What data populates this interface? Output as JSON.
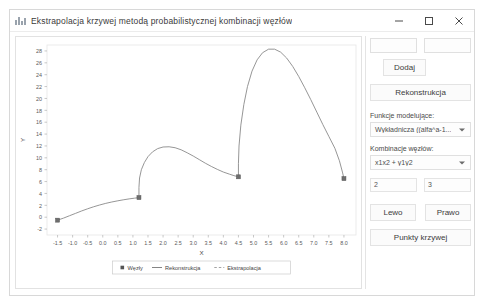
{
  "window": {
    "title": "Ekstrapolacja krzywej metodą probabilistycznej kombinacji węzłów",
    "icon": "chart-bars-icon",
    "minimize_label": "—",
    "maximize_label": "□",
    "close_label": "✕"
  },
  "panel": {
    "input_x": "",
    "input_y": "",
    "add_label": "Dodaj",
    "reconstruct_label": "Rekonstrukcja",
    "functions_label": "Funkcje modelujące:",
    "functions_value": "Wykładnicza ((alfa^a-1...",
    "combination_label": "Kombinacje węzłów:",
    "combination_value": "x1x2 + y1y2",
    "param_a": "2",
    "param_b": "3",
    "left_label": "Lewo",
    "right_label": "Prawo",
    "curve_points_label": "Punkty krzywej"
  },
  "chart_data": {
    "type": "line",
    "title": "",
    "xlabel": "X",
    "ylabel": "Y",
    "xlim": [
      -1.85,
      8.4
    ],
    "ylim": [
      -3.0,
      29.0
    ],
    "grid": false,
    "xticks": [
      -1.5,
      -1.0,
      -0.5,
      0.0,
      0.5,
      1.0,
      1.5,
      2.0,
      2.5,
      3.0,
      3.5,
      4.0,
      4.5,
      5.0,
      5.5,
      6.0,
      6.5,
      7.0,
      7.5,
      8.0
    ],
    "xticklabels": [
      "-1.5",
      "-1.0",
      "-0.5",
      "0.0",
      "0.5",
      "1.0",
      "1.5",
      "2.0",
      "2.5",
      "3.0",
      "3.5",
      "4.0",
      "4.5",
      "5.0",
      "5.5",
      "6.0",
      "6.5",
      "7.0",
      "7.5",
      "8.0"
    ],
    "yticks": [
      -2,
      0,
      2,
      4,
      6,
      8,
      10,
      12,
      14,
      16,
      18,
      20,
      22,
      24,
      26,
      28
    ],
    "yticklabels": [
      "-2",
      "0",
      "2",
      "4",
      "6",
      "8",
      "10",
      "12",
      "14",
      "16",
      "18",
      "20",
      "22",
      "24",
      "26",
      "28"
    ],
    "legend": {
      "position": "below-axes",
      "entries": [
        {
          "label": "Węzły",
          "marker": "square",
          "color": "#555555"
        },
        {
          "label": "Rekonstrukcja",
          "marker": "line",
          "color": "#777777"
        },
        {
          "label": "Ekstrapolacja",
          "marker": "dashed",
          "color": "#999999"
        }
      ]
    },
    "nodes": [
      {
        "x": -1.5,
        "y": -0.5
      },
      {
        "x": 1.2,
        "y": 3.3
      },
      {
        "x": 4.5,
        "y": 6.8
      },
      {
        "x": 8.0,
        "y": 6.5
      }
    ],
    "series": [
      {
        "name": "Rekonstrukcja",
        "color": "#8a8a8a",
        "points": [
          {
            "x": -1.5,
            "y": -0.5
          },
          {
            "x": -1.3,
            "y": -0.15
          },
          {
            "x": -1.1,
            "y": 0.25
          },
          {
            "x": -0.9,
            "y": 0.65
          },
          {
            "x": -0.7,
            "y": 1.05
          },
          {
            "x": -0.5,
            "y": 1.42
          },
          {
            "x": -0.3,
            "y": 1.76
          },
          {
            "x": -0.1,
            "y": 2.06
          },
          {
            "x": 0.1,
            "y": 2.33
          },
          {
            "x": 0.3,
            "y": 2.56
          },
          {
            "x": 0.5,
            "y": 2.76
          },
          {
            "x": 0.7,
            "y": 2.94
          },
          {
            "x": 0.9,
            "y": 3.1
          },
          {
            "x": 1.05,
            "y": 3.2
          },
          {
            "x": 1.2,
            "y": 3.3
          },
          {
            "x": 1.2,
            "y": 5.0
          },
          {
            "x": 1.22,
            "y": 6.6
          },
          {
            "x": 1.28,
            "y": 8.0
          },
          {
            "x": 1.38,
            "y": 9.2
          },
          {
            "x": 1.5,
            "y": 10.2
          },
          {
            "x": 1.65,
            "y": 11.0
          },
          {
            "x": 1.82,
            "y": 11.55
          },
          {
            "x": 2.0,
            "y": 11.82
          },
          {
            "x": 2.2,
            "y": 11.86
          },
          {
            "x": 2.4,
            "y": 11.7
          },
          {
            "x": 2.6,
            "y": 11.35
          },
          {
            "x": 2.8,
            "y": 10.85
          },
          {
            "x": 3.0,
            "y": 10.3
          },
          {
            "x": 3.2,
            "y": 9.7
          },
          {
            "x": 3.4,
            "y": 9.1
          },
          {
            "x": 3.6,
            "y": 8.55
          },
          {
            "x": 3.8,
            "y": 8.05
          },
          {
            "x": 4.0,
            "y": 7.6
          },
          {
            "x": 4.2,
            "y": 7.25
          },
          {
            "x": 4.35,
            "y": 7.0
          },
          {
            "x": 4.5,
            "y": 6.8
          },
          {
            "x": 4.5,
            "y": 9.0
          },
          {
            "x": 4.52,
            "y": 12.0
          },
          {
            "x": 4.58,
            "y": 15.5
          },
          {
            "x": 4.68,
            "y": 19.0
          },
          {
            "x": 4.8,
            "y": 22.0
          },
          {
            "x": 4.95,
            "y": 24.6
          },
          {
            "x": 5.12,
            "y": 26.5
          },
          {
            "x": 5.3,
            "y": 27.7
          },
          {
            "x": 5.5,
            "y": 28.3
          },
          {
            "x": 5.7,
            "y": 28.3
          },
          {
            "x": 5.9,
            "y": 27.8
          },
          {
            "x": 6.1,
            "y": 26.8
          },
          {
            "x": 6.3,
            "y": 25.4
          },
          {
            "x": 6.5,
            "y": 23.7
          },
          {
            "x": 6.7,
            "y": 21.8
          },
          {
            "x": 6.9,
            "y": 19.8
          },
          {
            "x": 7.1,
            "y": 17.7
          },
          {
            "x": 7.3,
            "y": 15.6
          },
          {
            "x": 7.5,
            "y": 13.6
          },
          {
            "x": 7.7,
            "y": 11.6
          },
          {
            "x": 7.85,
            "y": 9.5
          },
          {
            "x": 7.95,
            "y": 7.6
          },
          {
            "x": 8.0,
            "y": 6.5
          }
        ]
      }
    ]
  }
}
